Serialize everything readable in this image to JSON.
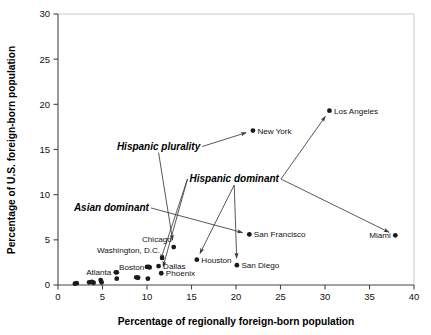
{
  "chart_data": {
    "type": "scatter",
    "title": "",
    "xlabel": "Percentage of regionally foreign-born population",
    "ylabel": "Percentage of U.S. foreign-born population",
    "xlim": [
      0,
      40
    ],
    "ylim": [
      0,
      30
    ],
    "xticks": [
      0,
      5,
      10,
      15,
      20,
      25,
      30,
      35,
      40
    ],
    "yticks": [
      0,
      5,
      10,
      15,
      20,
      25,
      30
    ],
    "xtick_labels": [
      "0",
      "5",
      "10",
      "15",
      "20",
      "25",
      "30",
      "35",
      "40"
    ],
    "ytick_labels": [
      "0",
      "5",
      "10",
      "15",
      "20",
      "25",
      "30"
    ],
    "grid": false,
    "legend": "none",
    "points": [
      {
        "label": "Los Angeles",
        "x": 30.5,
        "y": 19.3,
        "label_pos": "right"
      },
      {
        "label": "New York",
        "x": 21.9,
        "y": 17.1,
        "label_pos": "right"
      },
      {
        "label": "Miami",
        "x": 37.9,
        "y": 5.5,
        "label_pos": "left"
      },
      {
        "label": "San Francisco",
        "x": 21.5,
        "y": 5.6,
        "label_pos": "right"
      },
      {
        "label": "Chicago",
        "x": 13.0,
        "y": 4.2,
        "label_pos": "above-left"
      },
      {
        "label": "Washington, D.C.",
        "x": 11.7,
        "y": 3.0,
        "label_pos": "above-left"
      },
      {
        "label": "Houston",
        "x": 15.6,
        "y": 2.8,
        "label_pos": "right"
      },
      {
        "label": "San Diego",
        "x": 20.1,
        "y": 2.2,
        "label_pos": "right"
      },
      {
        "label": "Dallas",
        "x": 11.3,
        "y": 2.1,
        "label_pos": "right"
      },
      {
        "label": "Boston",
        "x": 10.2,
        "y": 2.0,
        "label_pos": "left"
      },
      {
        "label": "Phoenix",
        "x": 11.6,
        "y": 1.3,
        "label_pos": "right"
      },
      {
        "label": "Atlanta",
        "x": 6.5,
        "y": 1.4,
        "label_pos": "left"
      },
      {
        "label": "",
        "x": 1.9,
        "y": 0.15,
        "label_pos": "none"
      },
      {
        "label": "",
        "x": 2.1,
        "y": 0.2,
        "label_pos": "none"
      },
      {
        "label": "",
        "x": 3.5,
        "y": 0.3,
        "label_pos": "none"
      },
      {
        "label": "",
        "x": 3.8,
        "y": 0.35,
        "label_pos": "none"
      },
      {
        "label": "",
        "x": 4.0,
        "y": 0.25,
        "label_pos": "none"
      },
      {
        "label": "",
        "x": 4.8,
        "y": 0.55,
        "label_pos": "none"
      },
      {
        "label": "",
        "x": 4.9,
        "y": 0.3,
        "label_pos": "none"
      },
      {
        "label": "",
        "x": 6.6,
        "y": 1.4,
        "label_pos": "none"
      },
      {
        "label": "",
        "x": 6.6,
        "y": 0.7,
        "label_pos": "none"
      },
      {
        "label": "",
        "x": 8.8,
        "y": 0.85,
        "label_pos": "none"
      },
      {
        "label": "",
        "x": 9.0,
        "y": 0.8,
        "label_pos": "none"
      },
      {
        "label": "",
        "x": 10.1,
        "y": 0.7,
        "label_pos": "none"
      },
      {
        "label": "",
        "x": 10.0,
        "y": 2.0,
        "label_pos": "none"
      },
      {
        "label": "",
        "x": 10.3,
        "y": 1.95,
        "label_pos": "none"
      }
    ],
    "annotations": [
      {
        "text": "Hispanic plurality",
        "x": 11.3,
        "y": 15.0,
        "targets": [
          "New York",
          "Chicago"
        ]
      },
      {
        "text": "Hispanic dominant",
        "x": 19.8,
        "y": 11.4,
        "targets": [
          "Los Angeles",
          "Miami",
          "San Diego",
          "Houston",
          "Phoenix",
          "Dallas"
        ]
      },
      {
        "text": "Asian dominant",
        "x": 6.0,
        "y": 8.2,
        "targets": [
          "San Francisco"
        ]
      }
    ]
  }
}
